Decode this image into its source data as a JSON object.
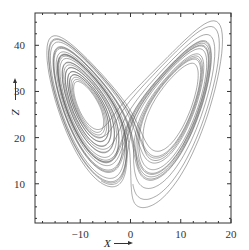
{
  "chart_data": {
    "type": "line",
    "title": "",
    "xlabel": "X",
    "ylabel": "Z",
    "xlim": [
      -19,
      20
    ],
    "ylim": [
      1.5,
      47
    ],
    "xticks": [
      -10,
      0,
      10,
      20
    ],
    "yticks": [
      10,
      20,
      30,
      40
    ],
    "xtick_labels": [
      "−10",
      "0",
      "10",
      "20"
    ],
    "ytick_labels": [
      "10",
      "20",
      "30",
      "40"
    ],
    "grid": false,
    "legend": null,
    "series": [
      {
        "name": "Lorenz trajectory",
        "system": {
          "sigma": 10,
          "rho": 28,
          "beta": 2.6667
        },
        "initial": [
          1.0,
          1.0,
          20.0
        ],
        "dt": 0.006,
        "steps": 5200,
        "skip": 300,
        "color": "#555555",
        "approx_extent": {
          "x": [
            -17.5,
            18
          ],
          "z": [
            6,
            44
          ]
        }
      }
    ],
    "annotations": [
      "arrow beside X label pointing right",
      "arrow beside Z label pointing up"
    ]
  },
  "layout": {
    "plot_px": {
      "left": 35,
      "right": 231,
      "top": 13,
      "bottom": 223
    },
    "line_color": "#555555",
    "axis_color": "#333333"
  }
}
